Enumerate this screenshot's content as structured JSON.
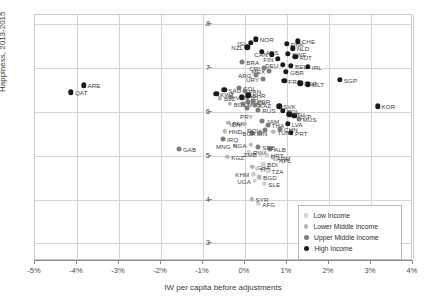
{
  "chart_data": {
    "type": "scatter",
    "title": "",
    "xlabel": "IW per capita before adjustments",
    "ylabel": "Happiness, 2013-2015",
    "xlim": [
      -5,
      4
    ],
    "ylim": [
      2.6,
      8.2
    ],
    "xticks": [
      "-5%",
      "-4%",
      "-3%",
      "-2%",
      "-1%",
      "0%",
      "1%",
      "2%",
      "3%",
      "4%"
    ],
    "xtick_values": [
      -5,
      -4,
      -3,
      -2,
      -1,
      0,
      1,
      2,
      3,
      4
    ],
    "yticks": [
      "8",
      "7",
      "6",
      "5",
      "4",
      "3"
    ],
    "ytick_values": [
      8,
      7,
      6,
      5,
      4,
      3
    ],
    "grid": true,
    "legend_position": "bottom-right",
    "legend": [
      {
        "key": "low",
        "label": "Low Income",
        "color": "#d0d0d0"
      },
      {
        "key": "lmid",
        "label": "Lower Middle Income",
        "color": "#b6b6b6"
      },
      {
        "key": "umid",
        "label": "Upper Middle Income",
        "color": "#7d7d7d"
      },
      {
        "key": "high",
        "label": "High Income",
        "color": "#1a1a1a"
      }
    ],
    "points": [
      {
        "label": "QAT",
        "x": -4.12,
        "y": 6.42,
        "group": "high",
        "lp": "right"
      },
      {
        "label": "ARE",
        "x": -3.82,
        "y": 6.58,
        "group": "high",
        "lp": "right"
      },
      {
        "label": "KWT",
        "x": -0.66,
        "y": 6.38,
        "group": "high",
        "lp": "right"
      },
      {
        "label": "SAU",
        "x": -0.47,
        "y": 6.48,
        "group": "high",
        "lp": "right"
      },
      {
        "label": "COL",
        "x": -0.12,
        "y": 6.52,
        "group": "umid",
        "lp": "right"
      },
      {
        "label": "BLZ",
        "x": -0.57,
        "y": 6.28,
        "group": "lmid",
        "lp": "right"
      },
      {
        "label": "VEN",
        "x": -0.3,
        "y": 6.31,
        "group": "umid",
        "lp": "right"
      },
      {
        "label": "TTO",
        "x": -0.05,
        "y": 6.3,
        "group": "high",
        "lp": "right"
      },
      {
        "label": "BOL",
        "x": -0.34,
        "y": 6.15,
        "group": "lmid",
        "lp": "right"
      },
      {
        "label": "ECU",
        "x": 0.1,
        "y": 6.2,
        "group": "umid",
        "lp": "right"
      },
      {
        "label": "PRY",
        "x": 0.06,
        "y": 6.05,
        "group": "umid",
        "lp": "below"
      },
      {
        "label": "PAK",
        "x": -0.37,
        "y": 5.72,
        "group": "lmid",
        "lp": "right"
      },
      {
        "label": "HND",
        "x": -0.46,
        "y": 5.53,
        "group": "lmid",
        "lp": "right"
      },
      {
        "label": "IRQ",
        "x": -0.5,
        "y": 5.35,
        "group": "umid",
        "lp": "right"
      },
      {
        "label": "IRN",
        "x": 0.2,
        "y": 5.5,
        "group": "umid",
        "lp": "right"
      },
      {
        "label": "GAB",
        "x": -1.55,
        "y": 5.12,
        "group": "umid",
        "lp": "right"
      },
      {
        "label": "KGZ",
        "x": -0.4,
        "y": 4.95,
        "group": "lmid",
        "lp": "right"
      },
      {
        "label": "NOR",
        "x": 0.28,
        "y": 7.62,
        "group": "high",
        "lp": "right"
      },
      {
        "label": "ISL",
        "x": 0.16,
        "y": 7.54,
        "group": "high",
        "lp": "left"
      },
      {
        "label": "NZL",
        "x": 0.08,
        "y": 7.44,
        "group": "high",
        "lp": "left"
      },
      {
        "label": "AUS",
        "x": 0.42,
        "y": 7.34,
        "group": "high",
        "lp": "right"
      },
      {
        "label": "CHE",
        "x": 1.28,
        "y": 7.58,
        "group": "high",
        "lp": "right"
      },
      {
        "label": "DNK",
        "x": 1.02,
        "y": 7.52,
        "group": "high",
        "lp": "right"
      },
      {
        "label": "NLD",
        "x": 1.16,
        "y": 7.42,
        "group": "high",
        "lp": "right"
      },
      {
        "label": "SWE",
        "x": 1.05,
        "y": 7.3,
        "group": "high",
        "lp": "right"
      },
      {
        "label": "AUT",
        "x": 1.22,
        "y": 7.22,
        "group": "high",
        "lp": "right"
      },
      {
        "label": "CAN",
        "x": 0.66,
        "y": 7.28,
        "group": "high",
        "lp": "left"
      },
      {
        "label": "FIN",
        "x": 0.8,
        "y": 7.18,
        "group": "high",
        "lp": "left"
      },
      {
        "label": "BEL",
        "x": 1.12,
        "y": 7.02,
        "group": "high",
        "lp": "right"
      },
      {
        "label": "IRL",
        "x": 1.52,
        "y": 7.0,
        "group": "high",
        "lp": "right"
      },
      {
        "label": "DEU",
        "x": 0.92,
        "y": 7.04,
        "group": "high",
        "lp": "left"
      },
      {
        "label": "GBR",
        "x": 1.0,
        "y": 6.88,
        "group": "high",
        "lp": "right"
      },
      {
        "label": "MEX",
        "x": 0.6,
        "y": 6.9,
        "group": "umid",
        "lp": "left"
      },
      {
        "label": "CRI",
        "x": 0.48,
        "y": 6.98,
        "group": "umid",
        "lp": "left"
      },
      {
        "label": "ARG",
        "x": 0.28,
        "y": 6.82,
        "group": "umid",
        "lp": "left"
      },
      {
        "label": "URY",
        "x": 0.46,
        "y": 6.72,
        "group": "umid",
        "lp": "left"
      },
      {
        "label": "FRA",
        "x": 0.96,
        "y": 6.68,
        "group": "high",
        "lp": "right"
      },
      {
        "label": "ESP",
        "x": 1.34,
        "y": 6.62,
        "group": "high",
        "lp": "right"
      },
      {
        "label": "MLT",
        "x": 1.52,
        "y": 6.6,
        "group": "high",
        "lp": "right"
      },
      {
        "label": "SGP",
        "x": 2.28,
        "y": 6.7,
        "group": "high",
        "lp": "right"
      },
      {
        "label": "KOR",
        "x": 3.18,
        "y": 6.1,
        "group": "high",
        "lp": "right"
      },
      {
        "label": "BRA",
        "x": -0.04,
        "y": 7.1,
        "group": "umid",
        "lp": "right"
      },
      {
        "label": "PAN",
        "x": 0.02,
        "y": 6.45,
        "group": "umid",
        "lp": "right"
      },
      {
        "label": "BHR",
        "x": 0.1,
        "y": 6.35,
        "group": "high",
        "lp": "right"
      },
      {
        "label": "PER",
        "x": 0.22,
        "y": 6.22,
        "group": "umid",
        "lp": "right"
      },
      {
        "label": "MYS",
        "x": -0.02,
        "y": 6.16,
        "group": "umid",
        "lp": "right"
      },
      {
        "label": "KAZ",
        "x": 0.26,
        "y": 6.12,
        "group": "umid",
        "lp": "right"
      },
      {
        "label": "RUS",
        "x": 0.34,
        "y": 6.02,
        "group": "umid",
        "lp": "right"
      },
      {
        "label": "SVK",
        "x": 0.84,
        "y": 6.1,
        "group": "high",
        "lp": "right"
      },
      {
        "label": "POL",
        "x": 0.92,
        "y": 6.0,
        "group": "high",
        "lp": "right"
      },
      {
        "label": "LTU",
        "x": 1.08,
        "y": 5.92,
        "group": "high",
        "lp": "right"
      },
      {
        "label": "CYP",
        "x": 1.2,
        "y": 5.88,
        "group": "high",
        "lp": "right"
      },
      {
        "label": "MUS",
        "x": 1.3,
        "y": 5.82,
        "group": "umid",
        "lp": "right"
      },
      {
        "label": "JAM",
        "x": 0.44,
        "y": 5.76,
        "group": "umid",
        "lp": "right"
      },
      {
        "label": "IDN",
        "x": 0.02,
        "y": 5.7,
        "group": "lmid",
        "lp": "left"
      },
      {
        "label": "THA",
        "x": 0.56,
        "y": 5.68,
        "group": "umid",
        "lp": "right"
      },
      {
        "label": "CHN",
        "x": 0.86,
        "y": 5.58,
        "group": "umid",
        "lp": "right"
      },
      {
        "label": "PRT",
        "x": 1.12,
        "y": 5.5,
        "group": "high",
        "lp": "right"
      },
      {
        "label": "TUN",
        "x": 0.7,
        "y": 5.52,
        "group": "lmid",
        "lp": "right"
      },
      {
        "label": "ROU",
        "x": 0.5,
        "y": 5.56,
        "group": "umid",
        "lp": "left"
      },
      {
        "label": "BGR",
        "x": 0.38,
        "y": 5.48,
        "group": "umid",
        "lp": "left"
      },
      {
        "label": "LVA",
        "x": 1.04,
        "y": 5.7,
        "group": "high",
        "lp": "right"
      },
      {
        "label": "ALB",
        "x": 0.62,
        "y": 5.12,
        "group": "umid",
        "lp": "right"
      },
      {
        "label": "NPL",
        "x": 0.74,
        "y": 4.88,
        "group": "low",
        "lp": "right"
      },
      {
        "label": "RWA",
        "x": 0.12,
        "y": 5.06,
        "group": "low",
        "lp": "right"
      },
      {
        "label": "MNG",
        "x": -0.22,
        "y": 5.2,
        "group": "lmid",
        "lp": "left"
      },
      {
        "label": "NGA",
        "x": 0.16,
        "y": 5.22,
        "group": "lmid",
        "lp": "left"
      },
      {
        "label": "SRB",
        "x": 0.34,
        "y": 5.18,
        "group": "umid",
        "lp": "right"
      },
      {
        "label": "GHA",
        "x": 0.2,
        "y": 4.72,
        "group": "lmid",
        "lp": "right"
      },
      {
        "label": "HTI",
        "x": 0.3,
        "y": 4.68,
        "group": "low",
        "lp": "right"
      },
      {
        "label": "BDI",
        "x": 0.46,
        "y": 4.78,
        "group": "low",
        "lp": "right"
      },
      {
        "label": "TZA",
        "x": 0.56,
        "y": 4.62,
        "group": "low",
        "lp": "right"
      },
      {
        "label": "KHM",
        "x": 0.22,
        "y": 4.55,
        "group": "low",
        "lp": "left"
      },
      {
        "label": "BGD",
        "x": 0.36,
        "y": 4.48,
        "group": "lmid",
        "lp": "right"
      },
      {
        "label": "SLE",
        "x": 0.48,
        "y": 4.34,
        "group": "low",
        "lp": "right"
      },
      {
        "label": "SYR",
        "x": 0.18,
        "y": 3.98,
        "group": "lmid",
        "lp": "right"
      },
      {
        "label": "AFG",
        "x": 0.34,
        "y": 3.88,
        "group": "low",
        "lp": "right"
      },
      {
        "label": "ARM",
        "x": 0.68,
        "y": 4.92,
        "group": "lmid",
        "lp": "right"
      },
      {
        "label": "HRT",
        "x": 0.54,
        "y": 4.98,
        "group": "low",
        "lp": "right"
      },
      {
        "label": "UGA",
        "x": 0.26,
        "y": 4.4,
        "group": "low",
        "lp": "left"
      },
      {
        "label": "ZMB",
        "x": 0.4,
        "y": 5.02,
        "group": "lmid",
        "lp": "left"
      }
    ]
  }
}
